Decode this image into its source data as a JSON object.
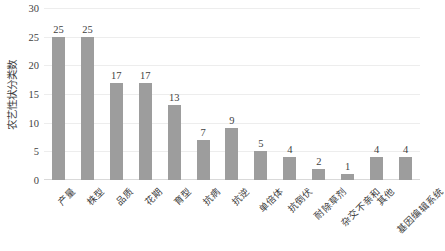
{
  "chart_data": {
    "type": "bar",
    "title": "",
    "xlabel": "",
    "ylabel": "农艺性状分类数",
    "ylim": [
      0,
      30
    ],
    "yticks": [
      0,
      5,
      10,
      15,
      20,
      25,
      30
    ],
    "grid": true,
    "legend": "none",
    "bar_color": "#9d9d9d",
    "categories": [
      "产量",
      "株型",
      "品质",
      "花期",
      "育型",
      "抗病",
      "抗逆",
      "单倍体",
      "抗倒伏",
      "耐除草剂",
      "杂交不亲和",
      "其他",
      "基因编辑系统"
    ],
    "values": [
      25,
      25,
      17,
      17,
      13,
      7,
      9,
      5,
      4,
      2,
      1,
      4,
      4
    ]
  }
}
